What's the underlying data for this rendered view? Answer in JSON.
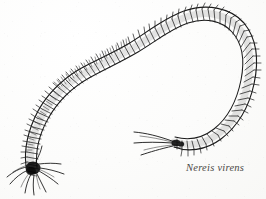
{
  "plate": {
    "kind": "scientific-illustration",
    "subject": "marine-polychaete-worm",
    "technique": "pen-and-ink-line-drawing",
    "background_color": "#fdfdfc",
    "ink_color": "#1a1a1a"
  },
  "caption": {
    "text": "Nereis virens",
    "style": "italic",
    "color": "#3b3936"
  },
  "figure": {
    "common_name_label": "",
    "head_label": "",
    "tail_label": "",
    "anatomy": {
      "head_icon": "worm-head-icon",
      "body_icon": "segmented-body-icon",
      "tail_icon": "worm-tail-icon",
      "parapodia_icon": "parapodia-bristles-icon"
    }
  },
  "geometry": {
    "body_path": "M 32,167 C 30,150 34,132 44,114 C 54,96 68,83 84,74 C 100,65 116,58 133,48 C 150,38 166,24 186,17 C 206,10 226,14 238,27 C 250,40 252,60 248,82 C 244,104 234,122 218,134 C 202,146 186,146 174,142",
    "tail_tip": [
      174,
      142
    ],
    "head_tip": [
      32,
      167
    ],
    "segment_count": 78
  }
}
